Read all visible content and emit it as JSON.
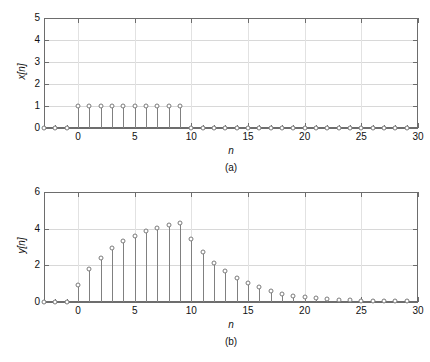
{
  "figure": {
    "title": "",
    "background": "#ffffff",
    "stem_color": "#808080",
    "marker_edge_color": "#7a7a7a",
    "marker_face_color": "#ffffff",
    "axis_color": "#6d6d6d",
    "grid_color": "#d8d8d8"
  },
  "panel_a": {
    "caption": "(a)",
    "ylabel": "x[n]",
    "xlabel": "n",
    "ytick_labels": [
      "0",
      "1",
      "2",
      "3",
      "4",
      "5"
    ],
    "xtick_labels": [
      "0",
      "5",
      "10",
      "15",
      "20",
      "25",
      "30"
    ]
  },
  "panel_b": {
    "caption": "(b)",
    "ylabel": "y[n]",
    "xlabel": "n",
    "ytick_labels": [
      "0",
      "2",
      "4",
      "6"
    ],
    "xtick_labels": [
      "0",
      "5",
      "10",
      "15",
      "20",
      "25",
      "30"
    ]
  },
  "chart_data": [
    {
      "type": "scatter",
      "subtype": "stem",
      "panel": "(a)",
      "title": "",
      "xlabel": "n",
      "ylabel": "x[n]",
      "xlim": [
        -3,
        30
      ],
      "ylim": [
        0,
        5
      ],
      "xticks": [
        0,
        5,
        10,
        15,
        20,
        25,
        30
      ],
      "yticks": [
        0,
        1,
        2,
        3,
        4,
        5
      ],
      "grid": true,
      "legend": null,
      "x": [
        -3,
        -2,
        -1,
        0,
        1,
        2,
        3,
        4,
        5,
        6,
        7,
        8,
        9,
        10,
        11,
        12,
        13,
        14,
        15,
        16,
        17,
        18,
        19,
        20,
        21,
        22,
        23,
        24,
        25,
        26,
        27,
        28,
        29
      ],
      "values": [
        0,
        0,
        0,
        1,
        1,
        1,
        1,
        1,
        1,
        1,
        1,
        1,
        1,
        0,
        0,
        0,
        0,
        0,
        0,
        0,
        0,
        0,
        0,
        0,
        0,
        0,
        0,
        0,
        0,
        0,
        0,
        0,
        0
      ]
    },
    {
      "type": "scatter",
      "subtype": "stem",
      "panel": "(b)",
      "title": "",
      "xlabel": "n",
      "ylabel": "y[n]",
      "xlim": [
        -3,
        30
      ],
      "ylim": [
        0,
        6
      ],
      "xticks": [
        0,
        5,
        10,
        15,
        20,
        25,
        30
      ],
      "yticks": [
        0,
        2,
        4,
        6
      ],
      "grid": true,
      "legend": null,
      "x": [
        -3,
        -2,
        -1,
        0,
        1,
        2,
        3,
        4,
        5,
        6,
        7,
        8,
        9,
        10,
        11,
        12,
        13,
        14,
        15,
        16,
        17,
        18,
        19,
        20,
        21,
        22,
        23,
        24,
        25,
        26,
        27,
        28,
        29
      ],
      "values": [
        0,
        0,
        0,
        0.95,
        1.78,
        2.38,
        2.92,
        3.32,
        3.6,
        3.85,
        4.05,
        4.22,
        4.33,
        3.45,
        2.75,
        2.15,
        1.68,
        1.32,
        1.05,
        0.8,
        0.58,
        0.45,
        0.35,
        0.28,
        0.22,
        0.17,
        0.13,
        0.1,
        0.08,
        0.06,
        0.05,
        0.04,
        0.03
      ]
    }
  ]
}
